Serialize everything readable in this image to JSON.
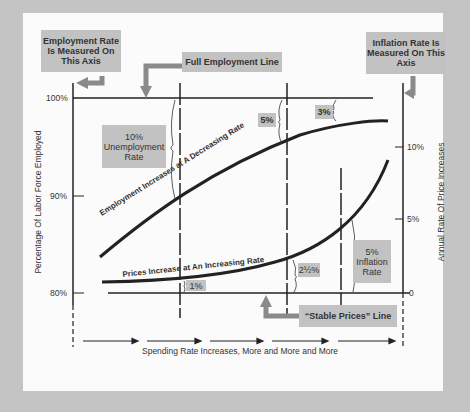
{
  "diagram": {
    "left_axis_callout": "Employment Rate Is Measured On This Axis",
    "right_axis_callout": "Inflation Rate Is Measured On This Axis",
    "full_employment_callout": "Full Employment Line",
    "stable_prices_callout": "“Stable Prices” Line",
    "left_axis_label": "Percentage Of Labor Force Employed",
    "right_axis_label": "Annual Rate Of Price Increases",
    "x_axis_label": "Spending Rate Increases, More and More and More",
    "left_ticks": [
      "100%",
      "90%",
      "80%"
    ],
    "right_ticks": [
      "10%",
      "5%",
      "0"
    ],
    "curves": {
      "employment": "Employment Increases at A Decreasing Rate",
      "prices": "Prices Increase at An Increasing Rate"
    },
    "gap_labels": {
      "unemployment_10": [
        "10%",
        "Unemployment",
        "Rate"
      ],
      "unemployment_5": "5%",
      "unemployment_3": "3%",
      "inflation_1": "1%",
      "inflation_2_5": "2½%",
      "inflation_5": [
        "5%",
        "Inflation",
        "Rate"
      ]
    },
    "colors": {
      "background": "#c4c4c4",
      "panel": "#fbfbfb",
      "callout": "#c2c2c2",
      "line": "#222222",
      "arrow": "#8a8a8a"
    }
  }
}
